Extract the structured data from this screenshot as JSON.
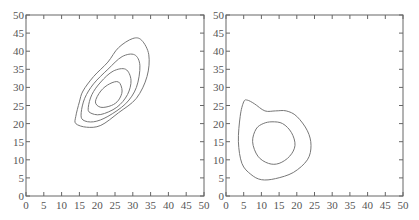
{
  "chart_data": [
    {
      "type": "contour",
      "title": "",
      "xlabel": "",
      "ylabel": "",
      "xlim": [
        0,
        50
      ],
      "ylim": [
        0,
        50
      ],
      "xticks": [
        0,
        5,
        10,
        15,
        20,
        25,
        30,
        35,
        40,
        45,
        50
      ],
      "yticks": [
        0,
        5,
        10,
        15,
        20,
        25,
        30,
        35,
        40,
        45,
        50
      ],
      "grid": false,
      "contours": [
        {
          "level": 1,
          "description": "outermost, tilted ellipse",
          "center": [
            24,
            31
          ],
          "x_range": [
            13.5,
            34.5
          ],
          "y_range": [
            19,
            43.5
          ]
        },
        {
          "level": 2,
          "center": [
            24,
            29.5
          ],
          "x_range": [
            15,
            32
          ],
          "y_range": [
            20.5,
            39
          ]
        },
        {
          "level": 3,
          "center": [
            24,
            28.5
          ],
          "x_range": [
            17,
            30
          ],
          "y_range": [
            22.5,
            35
          ]
        },
        {
          "level": 4,
          "description": "innermost",
          "center": [
            24,
            28
          ],
          "x_range": [
            19,
            27
          ],
          "y_range": [
            24.5,
            31.5
          ]
        }
      ]
    },
    {
      "type": "contour",
      "title": "",
      "xlabel": "",
      "ylabel": "",
      "xlim": [
        0,
        50
      ],
      "ylim": [
        0,
        50
      ],
      "xticks": [
        0,
        5,
        10,
        15,
        20,
        25,
        30,
        35,
        40,
        45,
        50
      ],
      "yticks": [
        0,
        5,
        10,
        15,
        20,
        25,
        30,
        35,
        40,
        45,
        50
      ],
      "grid": false,
      "contours": [
        {
          "level": 1,
          "description": "outer, irregular with bump at top-left",
          "center": [
            13,
            15
          ],
          "x_range": [
            3.5,
            24
          ],
          "y_range": [
            4.5,
            26.5
          ]
        },
        {
          "level": 2,
          "description": "inner roughly circular",
          "center": [
            13,
            14.5
          ],
          "x_range": [
            7.5,
            19.5
          ],
          "y_range": [
            8.5,
            20.5
          ]
        }
      ]
    }
  ]
}
